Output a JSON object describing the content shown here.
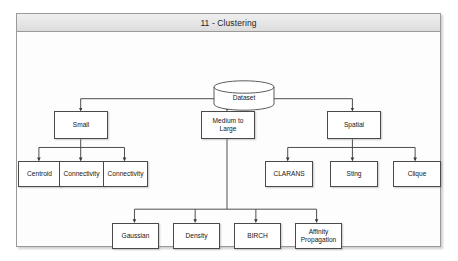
{
  "window": {
    "title": "11 - Clustering"
  },
  "diagram": {
    "root": {
      "label": "Dataset",
      "shape": "cylinder"
    },
    "level2": [
      {
        "label": "Small"
      },
      {
        "label": "Medium to\nLarge"
      },
      {
        "label": "Spatial"
      }
    ],
    "small_children": [
      {
        "label": "Centroid"
      },
      {
        "label": "Connectivity"
      },
      {
        "label": "Connectivity"
      }
    ],
    "spatial_children": [
      {
        "label": "CLARANS"
      },
      {
        "label": "Sting"
      },
      {
        "label": "Clique"
      }
    ],
    "medium_large_children": [
      {
        "label": "Gaussian"
      },
      {
        "label": "Density"
      },
      {
        "label": "BIRCH"
      },
      {
        "label": "Affinity\nPropagation"
      }
    ]
  },
  "colors": {
    "frame_border": "#9a9a9a",
    "titlebar_bg": "#e6e6e6",
    "node_border": "#4a4a4a",
    "node_fill": "#ffffff",
    "connector": "#3a3a3a",
    "canvas_bg": "#fdfdfd"
  }
}
